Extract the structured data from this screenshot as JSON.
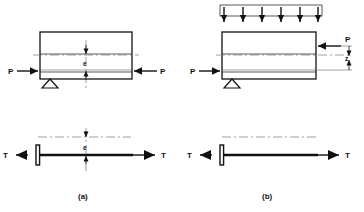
{
  "figure": {
    "background_color": "#ffffff",
    "line_color": "#111111",
    "centerline_color": "#777777"
  },
  "captions": {
    "left": "(a)",
    "right": "(b)"
  },
  "panel_a": {
    "name": "eccentric-axial-load-beam",
    "beam": {
      "label": "rectangular-member"
    },
    "loads": {
      "left_force_label": "P",
      "right_force_label": "P",
      "left_force_direction": "right",
      "right_force_direction": "left"
    },
    "support": {
      "type": "pinned",
      "label": "pin-support"
    },
    "dimension": {
      "label": "e",
      "meaning": "eccentricity"
    },
    "tension_member": {
      "left_force_label": "T",
      "right_force_label": "T",
      "dimension_label": "e"
    }
  },
  "panel_b": {
    "name": "eccentric-load-with-distributed-load-beam",
    "beam": {
      "label": "rectangular-member"
    },
    "distributed_load": {
      "label": "uniform-distributed-load",
      "arrow_count": 6,
      "direction": "down"
    },
    "loads": {
      "left_force_label": "P",
      "right_force_label": "P",
      "left_force_direction": "right",
      "right_force_direction": "left"
    },
    "support": {
      "type": "pinned",
      "label": "pin-support"
    },
    "dimension": {
      "label": "z",
      "meaning": "eccentricity"
    },
    "tension_member": {
      "left_force_label": "T",
      "right_force_label": "T"
    }
  }
}
